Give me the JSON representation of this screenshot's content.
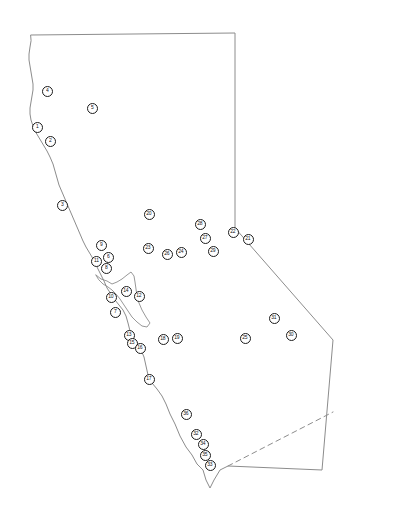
{
  "figure": {
    "width": 406,
    "height": 516,
    "background_color": "#ffffff"
  },
  "map": {
    "region_name": "California",
    "outline_color": "#8c8c8c",
    "outline_width": 1,
    "fill_color": "#ffffff",
    "borders": [
      {
        "name": "north-border",
        "style": "solid"
      },
      {
        "name": "pacific-coastline",
        "style": "solid"
      },
      {
        "name": "nevada-border",
        "style": "solid"
      },
      {
        "name": "mexico-border",
        "style": "dashed"
      }
    ]
  },
  "markers": {
    "shape": "circle",
    "fill_color": "#ffffff",
    "ring_color": "#1c1c1c",
    "label_color": "#111111",
    "diameter_px": 11,
    "count": 36,
    "items": [
      {
        "label": "1",
        "x": 37,
        "y": 127
      },
      {
        "label": "2",
        "x": 50,
        "y": 141
      },
      {
        "label": "3",
        "x": 62,
        "y": 205
      },
      {
        "label": "4",
        "x": 47,
        "y": 91
      },
      {
        "label": "5",
        "x": 92,
        "y": 108
      },
      {
        "label": "6",
        "x": 108,
        "y": 257
      },
      {
        "label": "7",
        "x": 115,
        "y": 312
      },
      {
        "label": "8",
        "x": 106,
        "y": 268
      },
      {
        "label": "9",
        "x": 101,
        "y": 245
      },
      {
        "label": "10",
        "x": 111,
        "y": 297
      },
      {
        "label": "11",
        "x": 96,
        "y": 261
      },
      {
        "label": "12",
        "x": 139,
        "y": 296
      },
      {
        "label": "13",
        "x": 129,
        "y": 335
      },
      {
        "label": "14",
        "x": 126,
        "y": 291
      },
      {
        "label": "15",
        "x": 132,
        "y": 343
      },
      {
        "label": "16",
        "x": 140,
        "y": 348
      },
      {
        "label": "17",
        "x": 149,
        "y": 379
      },
      {
        "label": "18",
        "x": 163,
        "y": 339
      },
      {
        "label": "19",
        "x": 177,
        "y": 338
      },
      {
        "label": "20",
        "x": 149,
        "y": 214
      },
      {
        "label": "21",
        "x": 248,
        "y": 239
      },
      {
        "label": "22",
        "x": 233,
        "y": 232
      },
      {
        "label": "23",
        "x": 148,
        "y": 248
      },
      {
        "label": "24",
        "x": 181,
        "y": 252
      },
      {
        "label": "25",
        "x": 245,
        "y": 338
      },
      {
        "label": "26",
        "x": 167,
        "y": 254
      },
      {
        "label": "27",
        "x": 205,
        "y": 238
      },
      {
        "label": "28",
        "x": 200,
        "y": 224
      },
      {
        "label": "29",
        "x": 213,
        "y": 251
      },
      {
        "label": "30",
        "x": 291,
        "y": 335
      },
      {
        "label": "31",
        "x": 274,
        "y": 318
      },
      {
        "label": "32",
        "x": 196,
        "y": 434
      },
      {
        "label": "33",
        "x": 210,
        "y": 465
      },
      {
        "label": "34",
        "x": 203,
        "y": 444
      },
      {
        "label": "35",
        "x": 205,
        "y": 455
      },
      {
        "label": "36",
        "x": 186,
        "y": 414
      }
    ]
  }
}
